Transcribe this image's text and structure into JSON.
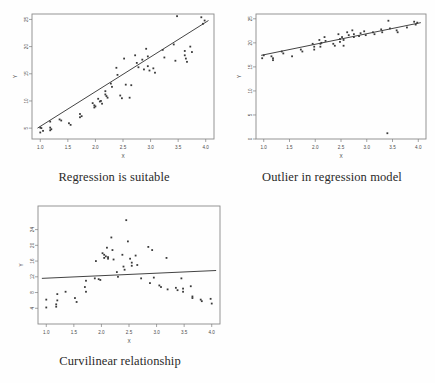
{
  "figure": {
    "background_color": "#fefefe",
    "point_color": "#3a3a3a",
    "line_color": "#2e2e2e",
    "frame_color": "#8a8a8a"
  },
  "panels": [
    {
      "id": "regression-suitable",
      "caption": "Regression is suitable"
    },
    {
      "id": "outlier-regression",
      "caption": "Outlier in regression model"
    },
    {
      "id": "curvilinear",
      "caption": "Curvilinear relationship"
    }
  ],
  "chart_data": [
    {
      "type": "scatter",
      "title": "Regression is suitable",
      "xlabel": "X",
      "ylabel": "Y",
      "xlim": [
        0.85,
        4.15
      ],
      "ylim": [
        3.0,
        26.0
      ],
      "xticks": [
        "1.0",
        "1.5",
        "2.0",
        "2.5",
        "3.0",
        "3.5",
        "4.0"
      ],
      "xtick_values": [
        1.0,
        1.5,
        2.0,
        2.5,
        3.0,
        3.5,
        4.0
      ],
      "yticks": [
        "5",
        "10",
        "15",
        "20",
        "25"
      ],
      "ytick_values": [
        5,
        10,
        15,
        20,
        25
      ],
      "grid": false,
      "legend": "none",
      "fit_line": {
        "x": [
          0.95,
          4.05
        ],
        "y": [
          5.0,
          24.8
        ]
      },
      "points": [
        [
          1.0,
          5.1
        ],
        [
          1.0,
          4.2
        ],
        [
          1.02,
          5.0
        ],
        [
          1.05,
          4.5
        ],
        [
          1.18,
          6.2
        ],
        [
          1.18,
          5.1
        ],
        [
          1.18,
          4.6
        ],
        [
          1.2,
          4.8
        ],
        [
          1.35,
          6.6
        ],
        [
          1.38,
          6.4
        ],
        [
          1.52,
          5.9
        ],
        [
          1.55,
          5.6
        ],
        [
          1.72,
          7.6
        ],
        [
          1.72,
          7.0
        ],
        [
          1.75,
          7.2
        ],
        [
          1.95,
          9.6
        ],
        [
          1.98,
          9.2
        ],
        [
          1.98,
          8.8
        ],
        [
          2.0,
          9.0
        ],
        [
          2.05,
          10.4
        ],
        [
          2.08,
          9.9
        ],
        [
          2.1,
          10.0
        ],
        [
          2.12,
          9.5
        ],
        [
          2.18,
          11.8
        ],
        [
          2.18,
          11.2
        ],
        [
          2.2,
          10.9
        ],
        [
          2.22,
          10.6
        ],
        [
          2.28,
          13.2
        ],
        [
          2.3,
          12.6
        ],
        [
          2.38,
          16.1
        ],
        [
          2.4,
          14.8
        ],
        [
          2.45,
          11.0
        ],
        [
          2.48,
          10.5
        ],
        [
          2.52,
          17.8
        ],
        [
          2.55,
          13.0
        ],
        [
          2.62,
          10.6
        ],
        [
          2.65,
          12.9
        ],
        [
          2.72,
          18.4
        ],
        [
          2.75,
          17.0
        ],
        [
          2.78,
          16.2
        ],
        [
          2.85,
          17.6
        ],
        [
          2.88,
          15.8
        ],
        [
          2.92,
          19.6
        ],
        [
          2.95,
          18.2
        ],
        [
          2.95,
          16.4
        ],
        [
          2.98,
          15.6
        ],
        [
          3.05,
          16.0
        ],
        [
          3.08,
          15.2
        ],
        [
          3.22,
          19.4
        ],
        [
          3.25,
          18.0
        ],
        [
          3.42,
          20.4
        ],
        [
          3.45,
          17.4
        ],
        [
          3.48,
          25.6
        ],
        [
          3.62,
          19.2
        ],
        [
          3.62,
          18.4
        ],
        [
          3.64,
          17.8
        ],
        [
          3.66,
          17.2
        ],
        [
          3.72,
          20.0
        ],
        [
          3.75,
          19.0
        ],
        [
          3.92,
          25.4
        ],
        [
          3.95,
          24.2
        ],
        [
          3.98,
          24.8
        ]
      ]
    },
    {
      "type": "scatter",
      "title": "Outlier in regression model",
      "xlabel": "X",
      "ylabel": "Y",
      "xlim": [
        0.85,
        4.15
      ],
      "ylim": [
        0.0,
        26.0
      ],
      "xticks": [
        "1.0",
        "1.5",
        "2.0",
        "2.5",
        "3.0",
        "3.5",
        "4.0"
      ],
      "xtick_values": [
        1.0,
        1.5,
        2.0,
        2.5,
        3.0,
        3.5,
        4.0
      ],
      "yticks": [
        "0",
        "5",
        "10",
        "15",
        "20",
        "25"
      ],
      "ytick_values": [
        0,
        5,
        10,
        15,
        20,
        25
      ],
      "grid": false,
      "legend": "none",
      "outlier": {
        "x": 3.4,
        "y": 1.2,
        "note": "single extreme low point"
      },
      "fit_line": {
        "x": [
          0.95,
          4.05
        ],
        "y": [
          17.4,
          24.2
        ]
      },
      "points": [
        [
          0.97,
          16.8
        ],
        [
          1.0,
          17.4
        ],
        [
          1.15,
          17.2
        ],
        [
          1.18,
          16.8
        ],
        [
          1.18,
          16.4
        ],
        [
          1.35,
          18.2
        ],
        [
          1.38,
          17.8
        ],
        [
          1.55,
          17.2
        ],
        [
          1.72,
          18.6
        ],
        [
          1.75,
          18.2
        ],
        [
          1.95,
          19.8
        ],
        [
          1.98,
          19.2
        ],
        [
          1.98,
          18.6
        ],
        [
          2.08,
          20.6
        ],
        [
          2.1,
          19.8
        ],
        [
          2.1,
          19.2
        ],
        [
          2.12,
          20.0
        ],
        [
          2.18,
          21.2
        ],
        [
          2.2,
          20.4
        ],
        [
          2.35,
          19.8
        ],
        [
          2.38,
          19.4
        ],
        [
          2.45,
          21.8
        ],
        [
          2.48,
          20.8
        ],
        [
          2.48,
          20.2
        ],
        [
          2.52,
          21.2
        ],
        [
          2.55,
          20.6
        ],
        [
          2.55,
          19.4
        ],
        [
          2.62,
          22.2
        ],
        [
          2.65,
          21.6
        ],
        [
          2.72,
          22.6
        ],
        [
          2.75,
          21.8
        ],
        [
          2.75,
          21.2
        ],
        [
          2.85,
          21.4
        ],
        [
          2.88,
          22.0
        ],
        [
          2.95,
          22.4
        ],
        [
          2.98,
          21.6
        ],
        [
          3.12,
          22.2
        ],
        [
          3.15,
          21.8
        ],
        [
          3.28,
          22.8
        ],
        [
          3.3,
          22.2
        ],
        [
          3.42,
          24.6
        ],
        [
          3.45,
          23.0
        ],
        [
          3.58,
          22.6
        ],
        [
          3.6,
          22.2
        ],
        [
          3.78,
          23.2
        ],
        [
          3.92,
          24.4
        ],
        [
          3.95,
          23.8
        ],
        [
          3.98,
          24.2
        ],
        [
          3.4,
          1.2
        ]
      ]
    },
    {
      "type": "scatter",
      "title": "Curvilinear relationship",
      "xlabel": "X",
      "ylabel": "Y",
      "xlim": [
        0.85,
        4.15
      ],
      "ylim": [
        0.0,
        30.0
      ],
      "xticks": [
        "1.0",
        "1.5",
        "2.0",
        "2.5",
        "3.0",
        "3.5",
        "4.0"
      ],
      "xtick_values": [
        1.0,
        1.5,
        2.0,
        2.5,
        3.0,
        3.5,
        4.0
      ],
      "yticks": [
        "4",
        "8",
        "12",
        "16",
        "20",
        "24"
      ],
      "ytick_values": [
        4,
        8,
        12,
        16,
        20,
        24
      ],
      "grid": false,
      "legend": "none",
      "pattern": "inverted-u peak near x=2.3",
      "fit_line": {
        "x": [
          0.92,
          4.08
        ],
        "y": [
          11.6,
          13.6
        ]
      },
      "points": [
        [
          1.0,
          4.2
        ],
        [
          1.0,
          6.2
        ],
        [
          1.18,
          5.0
        ],
        [
          1.18,
          4.4
        ],
        [
          1.2,
          7.6
        ],
        [
          1.2,
          6.0
        ],
        [
          1.35,
          8.2
        ],
        [
          1.52,
          6.6
        ],
        [
          1.55,
          5.6
        ],
        [
          1.7,
          9.4
        ],
        [
          1.72,
          11.0
        ],
        [
          1.72,
          8.2
        ],
        [
          1.88,
          11.6
        ],
        [
          1.9,
          16.0
        ],
        [
          1.95,
          11.4
        ],
        [
          1.98,
          11.2
        ],
        [
          2.02,
          18.0
        ],
        [
          2.05,
          17.6
        ],
        [
          2.05,
          16.8
        ],
        [
          2.08,
          17.2
        ],
        [
          2.1,
          19.4
        ],
        [
          2.12,
          17.0
        ],
        [
          2.12,
          16.6
        ],
        [
          2.18,
          22.0
        ],
        [
          2.2,
          18.8
        ],
        [
          2.22,
          16.4
        ],
        [
          2.28,
          13.2
        ],
        [
          2.3,
          12.0
        ],
        [
          2.38,
          17.6
        ],
        [
          2.4,
          14.6
        ],
        [
          2.42,
          13.8
        ],
        [
          2.45,
          26.4
        ],
        [
          2.48,
          21.0
        ],
        [
          2.52,
          16.6
        ],
        [
          2.55,
          15.6
        ],
        [
          2.55,
          14.8
        ],
        [
          2.62,
          17.4
        ],
        [
          2.65,
          15.0
        ],
        [
          2.72,
          11.6
        ],
        [
          2.85,
          19.6
        ],
        [
          2.88,
          10.4
        ],
        [
          2.92,
          18.8
        ],
        [
          2.95,
          11.8
        ],
        [
          3.05,
          9.8
        ],
        [
          3.08,
          9.4
        ],
        [
          3.18,
          16.8
        ],
        [
          3.2,
          8.8
        ],
        [
          3.35,
          9.2
        ],
        [
          3.38,
          8.6
        ],
        [
          3.45,
          11.6
        ],
        [
          3.48,
          9.0
        ],
        [
          3.48,
          8.2
        ],
        [
          3.62,
          9.6
        ],
        [
          3.65,
          6.6
        ],
        [
          3.65,
          7.0
        ],
        [
          3.8,
          6.2
        ],
        [
          3.82,
          5.8
        ],
        [
          3.98,
          6.4
        ],
        [
          4.0,
          5.2
        ]
      ]
    }
  ]
}
